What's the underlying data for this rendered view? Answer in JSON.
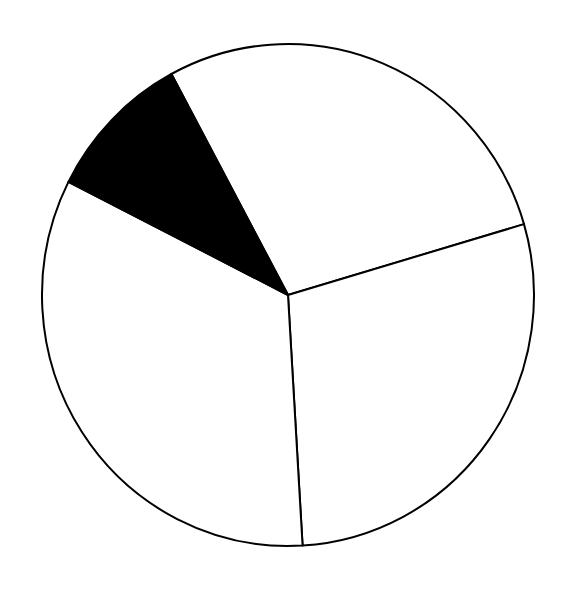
{
  "chart_data": {
    "type": "pie",
    "title": "",
    "legend": [],
    "slices": [
      {
        "label": "",
        "value": 28.3,
        "fill": "#ffffff",
        "start_deg": 331.7,
        "end_deg": 73.6
      },
      {
        "label": "",
        "value": 28.6,
        "fill": "#ffffff",
        "start_deg": 73.6,
        "end_deg": 176.6
      },
      {
        "label": "",
        "value": 33.4,
        "fill": "#ffffff",
        "start_deg": 176.6,
        "end_deg": 296.8
      },
      {
        "label": "",
        "value": 9.7,
        "fill": "#000000",
        "start_deg": 296.8,
        "end_deg": 331.7
      }
    ],
    "center": [
      288,
      295
    ],
    "radius_x": 246,
    "radius_y": 251,
    "stroke": "#000000"
  }
}
